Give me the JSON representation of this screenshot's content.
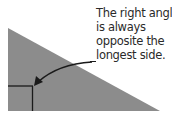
{
  "diagram": {
    "annotation": {
      "lines": [
        "The right angle",
        "is always",
        "opposite the",
        "longest side."
      ]
    },
    "colors": {
      "triangle_fill": "#8c8c8c",
      "stroke": "#1a1a1a",
      "background": "#ffffff"
    },
    "icons": {
      "arrow": "curved-arrow-icon",
      "right_angle": "right-angle-marker-icon"
    }
  }
}
